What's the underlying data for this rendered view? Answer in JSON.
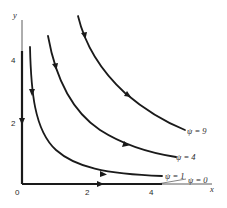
{
  "diagram": {
    "axes": {
      "x_label": "x",
      "y_label": "y",
      "x_ticks": [
        "0",
        "2",
        "4"
      ],
      "y_ticks": [
        "2",
        "4"
      ]
    },
    "streamlines": [
      {
        "label": "ψ = 9",
        "psi": 9
      },
      {
        "label": "ψ = 4",
        "psi": 4
      },
      {
        "label": "ψ = 1",
        "psi": 1
      },
      {
        "label": "ψ = 0",
        "psi": 0
      }
    ],
    "colors": {
      "ink": "#1a1a1a",
      "background": "#ffffff"
    }
  }
}
